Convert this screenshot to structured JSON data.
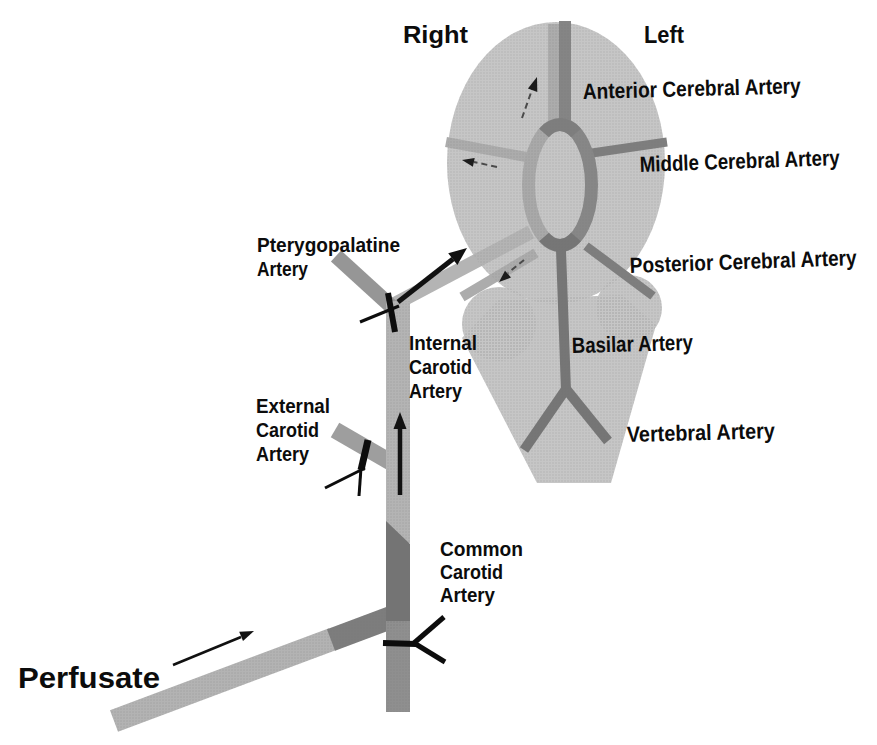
{
  "labels": {
    "right": "Right",
    "left": "Left",
    "anterior_cerebral": "Anterior Cerebral Artery",
    "middle_cerebral": "Middle Cerebral Artery",
    "posterior_cerebral": "Posterior Cerebral Artery",
    "basilar": "Basilar Artery",
    "vertebral": "Vertebral Artery",
    "pterygopalatine": [
      "Pterygopalatine",
      "Artery"
    ],
    "internal_carotid": [
      "Internal",
      "Carotid",
      "Artery"
    ],
    "external_carotid": [
      "External",
      "Carotid",
      "Artery"
    ],
    "common_carotid": [
      "Common",
      "Carotid",
      "Artery"
    ],
    "perfusate": "Perfusate"
  },
  "icons": {
    "flow_arrow": "➤",
    "ligation_mark": "✕"
  },
  "colors": {
    "background": "#ffffff",
    "brain": "#c6c6c6",
    "vessel_perfused_light": "#b4b4b4",
    "vessel_inner_light": "#acacac",
    "vessel_dark": "#7e7e7e",
    "circle_of_willis_left": "#a9a9a9",
    "circle_of_willis_right": "#878787",
    "basilar_dark": "#767676",
    "common_carotid_upper": "#747474",
    "common_carotid_lower": "#8f8f8f",
    "cannula": "#b3b3b3",
    "cannula_tip": "#7d7d7d",
    "pterygopalatine_vessel": "#969696",
    "external_carotid_vessel": "#9e9e9e",
    "marks": "#0d0d0d",
    "text": "#0c0c0c"
  }
}
